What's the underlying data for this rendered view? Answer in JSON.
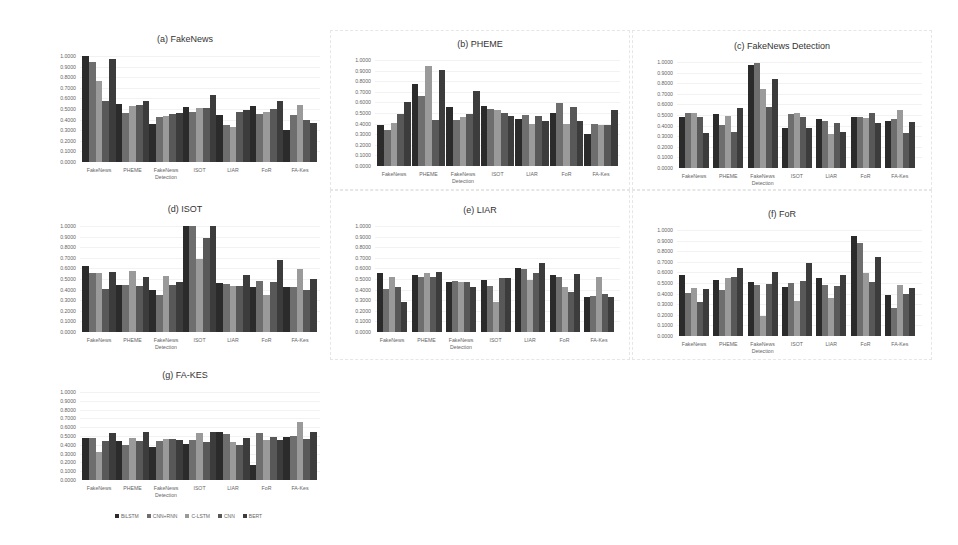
{
  "legend": [
    "BiLSTM",
    "CNN+RNN",
    "C-LSTM",
    "CNN",
    "BERT"
  ],
  "series_colors": [
    "#2b2b2b",
    "#6e6e6e",
    "#9a9a9a",
    "#585858",
    "#3c3c3c"
  ],
  "yticks": [
    "0.0000",
    "0.1000",
    "0.2000",
    "0.3000",
    "0.4000",
    "0.5000",
    "0.6000",
    "0.7000",
    "0.8000",
    "0.9000",
    "1.0000"
  ],
  "chart_data": [
    {
      "type": "bar",
      "title": "(a) FakeNews",
      "categories": [
        "FakeNews",
        "PHEME",
        "FakeNews Detection",
        "ISOT",
        "LIAR",
        "FoR",
        "FA-Kes"
      ],
      "series": [
        {
          "name": "BiLSTM",
          "values": [
            1.0,
            0.55,
            0.36,
            0.52,
            0.44,
            0.53,
            0.3
          ]
        },
        {
          "name": "CNN+RNN",
          "values": [
            0.94,
            0.46,
            0.42,
            0.47,
            0.35,
            0.45,
            0.44
          ]
        },
        {
          "name": "C-LSTM",
          "values": [
            0.76,
            0.53,
            0.43,
            0.51,
            0.33,
            0.47,
            0.54
          ]
        },
        {
          "name": "CNN",
          "values": [
            0.58,
            0.54,
            0.45,
            0.51,
            0.47,
            0.5,
            0.4
          ]
        },
        {
          "name": "BERT",
          "values": [
            0.97,
            0.58,
            0.46,
            0.63,
            0.49,
            0.58,
            0.37
          ]
        }
      ],
      "xlabel": "",
      "ylabel": "",
      "ylim": [
        0,
        1
      ],
      "grid": true,
      "legend_position": "bottom"
    },
    {
      "type": "bar",
      "title": "(b) PHEME",
      "categories": [
        "FakeNews",
        "PHEME",
        "FakeNews Detection",
        "ISOT",
        "LIAR",
        "FoR",
        "FA-Kes"
      ],
      "series": [
        {
          "name": "BiLSTM",
          "values": [
            0.39,
            0.77,
            0.56,
            0.57,
            0.44,
            0.5,
            0.3
          ]
        },
        {
          "name": "CNN+RNN",
          "values": [
            0.34,
            0.66,
            0.43,
            0.54,
            0.48,
            0.59,
            0.4
          ]
        },
        {
          "name": "C-LSTM",
          "values": [
            0.41,
            0.94,
            0.46,
            0.53,
            0.4,
            0.4,
            0.39
          ]
        },
        {
          "name": "CNN",
          "values": [
            0.49,
            0.43,
            0.49,
            0.5,
            0.47,
            0.56,
            0.39
          ]
        },
        {
          "name": "BERT",
          "values": [
            0.6,
            0.91,
            0.71,
            0.47,
            0.42,
            0.42,
            0.53
          ]
        }
      ],
      "xlabel": "",
      "ylabel": "",
      "ylim": [
        0,
        1
      ],
      "grid": true,
      "legend_position": "bottom"
    },
    {
      "type": "bar",
      "title": "(c) FakeNews Detection",
      "categories": [
        "FakeNews",
        "PHEME",
        "FakeNews Detection",
        "ISOT",
        "LIAR",
        "FoR",
        "FA-Kes"
      ],
      "series": [
        {
          "name": "BiLSTM",
          "values": [
            0.48,
            0.51,
            0.97,
            0.38,
            0.46,
            0.48,
            0.44
          ]
        },
        {
          "name": "CNN+RNN",
          "values": [
            0.52,
            0.41,
            0.99,
            0.51,
            0.44,
            0.48,
            0.46
          ]
        },
        {
          "name": "C-LSTM",
          "values": [
            0.52,
            0.49,
            0.75,
            0.52,
            0.32,
            0.47,
            0.55
          ]
        },
        {
          "name": "CNN",
          "values": [
            0.48,
            0.34,
            0.58,
            0.48,
            0.42,
            0.52,
            0.33
          ]
        },
        {
          "name": "BERT",
          "values": [
            0.33,
            0.57,
            0.84,
            0.38,
            0.34,
            0.42,
            0.43
          ]
        }
      ],
      "xlabel": "",
      "ylabel": "",
      "ylim": [
        0,
        1
      ],
      "grid": true,
      "legend_position": "bottom"
    },
    {
      "type": "bar",
      "title": "(d) ISOT",
      "categories": [
        "FakeNews",
        "PHEME",
        "FakeNews Detection",
        "ISOT",
        "LIAR",
        "FoR",
        "FA-Kes"
      ],
      "series": [
        {
          "name": "BiLSTM",
          "values": [
            0.62,
            0.44,
            0.4,
            1.0,
            0.46,
            0.42,
            0.42
          ]
        },
        {
          "name": "CNN+RNN",
          "values": [
            0.56,
            0.44,
            0.35,
            1.0,
            0.45,
            0.48,
            0.42
          ]
        },
        {
          "name": "C-LSTM",
          "values": [
            0.56,
            0.58,
            0.53,
            0.69,
            0.43,
            0.35,
            0.59
          ]
        },
        {
          "name": "CNN",
          "values": [
            0.41,
            0.43,
            0.44,
            0.89,
            0.43,
            0.47,
            0.4
          ]
        },
        {
          "name": "BERT",
          "values": [
            0.57,
            0.52,
            0.47,
            1.0,
            0.54,
            0.68,
            0.5
          ]
        }
      ],
      "xlabel": "",
      "ylabel": "",
      "ylim": [
        0,
        1
      ],
      "grid": true,
      "legend_position": "bottom"
    },
    {
      "type": "bar",
      "title": "(e) LIAR",
      "categories": [
        "FakeNews",
        "PHEME",
        "FakeNews Detection",
        "ISOT",
        "LIAR",
        "FoR",
        "FA-Kes"
      ],
      "series": [
        {
          "name": "BiLSTM",
          "values": [
            0.56,
            0.54,
            0.47,
            0.49,
            0.6,
            0.54,
            0.33
          ]
        },
        {
          "name": "CNN+RNN",
          "values": [
            0.41,
            0.52,
            0.48,
            0.43,
            0.59,
            0.52,
            0.34
          ]
        },
        {
          "name": "C-LSTM",
          "values": [
            0.52,
            0.56,
            0.47,
            0.28,
            0.49,
            0.42,
            0.52
          ]
        },
        {
          "name": "CNN",
          "values": [
            0.42,
            0.52,
            0.47,
            0.51,
            0.56,
            0.38,
            0.36
          ]
        },
        {
          "name": "BERT",
          "values": [
            0.28,
            0.57,
            0.42,
            0.51,
            0.65,
            0.55,
            0.33
          ]
        }
      ],
      "xlabel": "",
      "ylabel": "",
      "ylim": [
        0,
        1
      ],
      "grid": true,
      "legend_position": "bottom"
    },
    {
      "type": "bar",
      "title": "(f) FoR",
      "categories": [
        "FakeNews",
        "PHEME",
        "FakeNews Detection",
        "ISOT",
        "LIAR",
        "FoR",
        "FA-Kes"
      ],
      "series": [
        {
          "name": "BiLSTM",
          "values": [
            0.58,
            0.53,
            0.51,
            0.46,
            0.55,
            0.94,
            0.39
          ]
        },
        {
          "name": "CNN+RNN",
          "values": [
            0.41,
            0.43,
            0.48,
            0.5,
            0.48,
            0.88,
            0.26
          ]
        },
        {
          "name": "C-LSTM",
          "values": [
            0.45,
            0.55,
            0.19,
            0.33,
            0.36,
            0.59,
            0.48
          ]
        },
        {
          "name": "CNN",
          "values": [
            0.32,
            0.56,
            0.49,
            0.52,
            0.47,
            0.51,
            0.4
          ]
        },
        {
          "name": "BERT",
          "values": [
            0.44,
            0.64,
            0.6,
            0.69,
            0.58,
            0.75,
            0.45
          ]
        }
      ],
      "xlabel": "",
      "ylabel": "",
      "ylim": [
        0,
        1
      ],
      "grid": true,
      "legend_position": "bottom"
    },
    {
      "type": "bar",
      "title": "(g) FA-KES",
      "categories": [
        "FakeNews",
        "PHEME",
        "FakeNews Detection",
        "ISOT",
        "LIAR",
        "FoR",
        "FA-Kes"
      ],
      "series": [
        {
          "name": "BiLSTM",
          "values": [
            0.48,
            0.44,
            0.38,
            0.41,
            0.54,
            0.17,
            0.49
          ]
        },
        {
          "name": "CNN+RNN",
          "values": [
            0.48,
            0.4,
            0.44,
            0.46,
            0.52,
            0.53,
            0.5
          ]
        },
        {
          "name": "C-LSTM",
          "values": [
            0.32,
            0.48,
            0.47,
            0.53,
            0.43,
            0.45,
            0.66
          ]
        },
        {
          "name": "CNN",
          "values": [
            0.44,
            0.44,
            0.47,
            0.43,
            0.4,
            0.49,
            0.47
          ]
        },
        {
          "name": "BERT",
          "values": [
            0.53,
            0.54,
            0.46,
            0.55,
            0.48,
            0.45,
            0.54
          ]
        }
      ],
      "xlabel": "",
      "ylabel": "",
      "ylim": [
        0,
        1
      ],
      "grid": true,
      "legend_position": "bottom"
    }
  ],
  "panels": [
    {
      "x": 40,
      "y": 30,
      "w": 290,
      "h": 160,
      "plotX": 80,
      "plotY": 56,
      "plotW": 240,
      "plotH": 106,
      "groupW": 34,
      "gap": 33.5,
      "bordered": false
    },
    {
      "x": 330,
      "y": 30,
      "w": 300,
      "h": 160,
      "plotX": 375,
      "plotY": 60,
      "plotW": 245,
      "plotH": 106,
      "groupW": 34,
      "gap": 34.5,
      "bordered": true
    },
    {
      "x": 632,
      "y": 30,
      "w": 300,
      "h": 160,
      "plotX": 677,
      "plotY": 62,
      "plotW": 245,
      "plotH": 106,
      "groupW": 30,
      "gap": 34.3,
      "bordered": true
    },
    {
      "x": 40,
      "y": 190,
      "w": 290,
      "h": 170,
      "plotX": 80,
      "plotY": 226,
      "plotW": 240,
      "plotH": 106,
      "groupW": 34,
      "gap": 33.5,
      "bordered": false
    },
    {
      "x": 330,
      "y": 190,
      "w": 300,
      "h": 170,
      "plotX": 375,
      "plotY": 226,
      "plotW": 245,
      "plotH": 106,
      "groupW": 30,
      "gap": 34.5,
      "bordered": true
    },
    {
      "x": 632,
      "y": 190,
      "w": 300,
      "h": 170,
      "plotX": 677,
      "plotY": 230,
      "plotW": 245,
      "plotH": 106,
      "groupW": 30,
      "gap": 34.3,
      "bordered": true
    },
    {
      "x": 40,
      "y": 360,
      "w": 290,
      "h": 170,
      "plotX": 80,
      "plotY": 392,
      "plotW": 240,
      "plotH": 88,
      "groupW": 34,
      "gap": 33.5,
      "bordered": false
    }
  ],
  "xlabels_display": [
    "FakeNews",
    "PHEME",
    "FakeNews\nDetection",
    "ISOT",
    "LIAR",
    "FoR",
    "FA-Kes"
  ]
}
